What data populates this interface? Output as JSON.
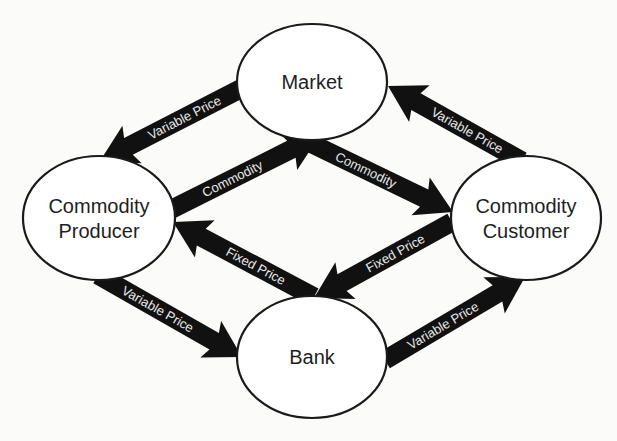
{
  "diagram": {
    "background": "#fbfbf9",
    "nodes": [
      {
        "id": "market",
        "label_lines": [
          "Market"
        ],
        "cx": 312,
        "cy": 82,
        "rx": 75,
        "ry": 58
      },
      {
        "id": "producer",
        "label_lines": [
          "Commodity",
          "Producer"
        ],
        "cx": 99,
        "cy": 218,
        "rx": 76,
        "ry": 62
      },
      {
        "id": "customer",
        "label_lines": [
          "Commodity",
          "Customer"
        ],
        "cx": 526,
        "cy": 218,
        "rx": 75,
        "ry": 62
      },
      {
        "id": "bank",
        "label_lines": [
          "Bank"
        ],
        "cx": 312,
        "cy": 357,
        "rx": 75,
        "ry": 61
      }
    ],
    "edges": [
      {
        "from": "market",
        "to": "producer",
        "label": "Variable Price",
        "x1": 244,
        "y1": 87,
        "x2": 100,
        "y2": 161
      },
      {
        "from": "customer",
        "to": "market",
        "label": "Variable Price",
        "x1": 522,
        "y1": 161,
        "x2": 388,
        "y2": 86
      },
      {
        "from": "producer",
        "to": "market",
        "label": "Commodity",
        "x1": 170,
        "y1": 210,
        "x2": 320,
        "y2": 135
      },
      {
        "from": "market",
        "to": "customer",
        "label": "Commodity",
        "x1": 304,
        "y1": 140,
        "x2": 453,
        "y2": 212
      },
      {
        "from": "customer",
        "to": "bank",
        "label": "Fixed Price",
        "x1": 452,
        "y1": 222,
        "x2": 314,
        "y2": 298
      },
      {
        "from": "bank",
        "to": "producer",
        "label": "Fixed Price",
        "x1": 314,
        "y1": 297,
        "x2": 173,
        "y2": 222
      },
      {
        "from": "producer",
        "to": "bank",
        "label": "Variable Price",
        "x1": 98,
        "y1": 275,
        "x2": 242,
        "y2": 357
      },
      {
        "from": "bank",
        "to": "customer",
        "label": "Variable Price",
        "x1": 385,
        "y1": 360,
        "x2": 525,
        "y2": 277
      }
    ],
    "arrow_style": {
      "shaft_width": 19,
      "head_width": 42,
      "head_length": 32,
      "color": "#111111",
      "label_color": "#e8e8e8"
    }
  }
}
